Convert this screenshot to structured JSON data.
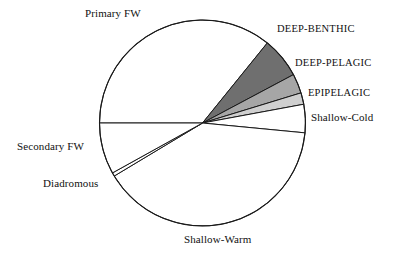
{
  "chart_data": {
    "type": "pie",
    "title": "",
    "subtitle": "",
    "xlabel": "",
    "ylabel": "",
    "legend_position": "none",
    "grid": false,
    "labels_outside": true,
    "center": {
      "x": 202.5,
      "y": 123
    },
    "radius": 103,
    "categories": [
      "Primary FW",
      "DEEP-BENTHIC",
      "DEEP-PELAGIC",
      "EPIPELAGIC",
      "Shallow-Cold",
      "Shallow-Warm",
      "Diadromous",
      "Secondary FW"
    ],
    "values": [
      35.8,
      6.4,
      3.1,
      1.8,
      4.4,
      46.1,
      0.6,
      1.8
    ],
    "slices": [
      {
        "name": "Primary FW",
        "label": "Primary FW",
        "value": 35.8,
        "start_angle": 51,
        "end_angle": 180,
        "color": "#ffffff",
        "stroke": "#1a1a1a"
      },
      {
        "name": "DEEP-BENTHIC",
        "label": "DEEP-BENTHIC",
        "value": 6.4,
        "start_angle": 28,
        "end_angle": 51,
        "color": "#6f6f6f",
        "stroke": "#1a1a1a"
      },
      {
        "name": "DEEP-PELAGIC",
        "label": "DEEP-PELAGIC",
        "value": 3.1,
        "start_angle": 17,
        "end_angle": 28,
        "color": "#a6a6a6",
        "stroke": "#1a1a1a"
      },
      {
        "name": "EPIPELAGIC",
        "label": "EPIPELAGIC",
        "value": 1.8,
        "start_angle": 10.5,
        "end_angle": 17,
        "color": "#cfcfcf",
        "stroke": "#1a1a1a"
      },
      {
        "name": "Shallow-Cold",
        "label": "Shallow-Cold",
        "value": 4.4,
        "start_angle": -5.5,
        "end_angle": 10.5,
        "color": "#ffffff",
        "stroke": "#1a1a1a"
      },
      {
        "name": "Shallow-Warm",
        "label": "Shallow-Warm",
        "value": 46.1,
        "start_angle": -149,
        "end_angle": -5.5,
        "color": "#ffffff",
        "stroke": "#1a1a1a"
      },
      {
        "name": "Diadromous",
        "label": "Diadromous",
        "value": 0.6,
        "start_angle": -151,
        "end_angle": -149,
        "color": "#ffffff",
        "stroke": "#1a1a1a"
      },
      {
        "name": "Secondary FW",
        "label": "Secondary FW",
        "value": 1.8,
        "start_angle": -180,
        "end_angle": -151,
        "color": "#ffffff",
        "stroke": "#1a1a1a"
      }
    ],
    "colors": {
      "outline": "#1a1a1a",
      "background": "#ffffff",
      "deep_benthic": "#6f6f6f",
      "deep_pelagic": "#a6a6a6",
      "epipelagic": "#cfcfcf",
      "unshaded": "#ffffff",
      "text": "#111111"
    }
  },
  "labels": {
    "primary_fw": "Primary FW",
    "deep_benthic": "DEEP-BENTHIC",
    "deep_pelagic": "DEEP-PELAGIC",
    "epipelagic": "EPIPELAGIC",
    "shallow_cold": "Shallow-Cold",
    "shallow_warm": "Shallow-Warm",
    "diadromous": "Diadromous",
    "secondary_fw": "Secondary FW"
  }
}
